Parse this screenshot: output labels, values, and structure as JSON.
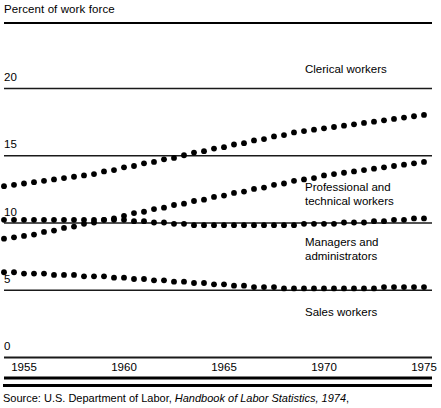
{
  "title": "Percent of work force",
  "source": {
    "prefix": "Source: U.S. Department of Labor, ",
    "italic": "Handbook of Labor Statistics, 1974",
    "suffix": ","
  },
  "axis": {
    "y_ticks": [
      "20",
      "15",
      "10",
      "5",
      "0"
    ],
    "x_ticks": [
      "1955",
      "1960",
      "1965",
      "1970",
      "1975"
    ]
  },
  "labels": {
    "clerical": "Clerical workers",
    "professional_line1": "Professional and",
    "professional_line2": "technical workers",
    "managers_line1": "Managers and",
    "managers_line2": "administrators",
    "sales": "Sales workers"
  },
  "colors": {
    "ink": "#000000",
    "rule": "#1a1a1a"
  },
  "chart_data": {
    "type": "scatter",
    "title": "Percent of work force",
    "xlabel": "",
    "ylabel": "Percent of work force",
    "xlim": [
      1954,
      1975.5
    ],
    "ylim": [
      0,
      21
    ],
    "ytick_values": [
      20,
      15,
      10,
      5,
      0
    ],
    "xtick_values": [
      1955,
      1960,
      1965,
      1970,
      1975
    ],
    "grid": "horizontal gridlines at each y tick",
    "legend_position": "inline labels at right of each series",
    "x": [
      1954,
      1954.5,
      1955,
      1955.5,
      1956,
      1956.5,
      1957,
      1957.5,
      1958,
      1958.5,
      1959,
      1959.5,
      1960,
      1960.5,
      1961,
      1961.5,
      1962,
      1962.5,
      1963,
      1963.5,
      1964,
      1964.5,
      1965,
      1965.5,
      1966,
      1966.5,
      1967,
      1967.5,
      1968,
      1968.5,
      1969,
      1969.5,
      1970,
      1970.5,
      1971,
      1971.5,
      1972,
      1972.5,
      1973,
      1973.5,
      1974,
      1974.5,
      1975
    ],
    "series": [
      {
        "name": "Clerical workers",
        "values": [
          12.7,
          12.8,
          12.9,
          13.0,
          13.1,
          13.2,
          13.3,
          13.4,
          13.5,
          13.6,
          13.8,
          13.9,
          14.1,
          14.2,
          14.4,
          14.5,
          14.7,
          14.8,
          15.0,
          15.2,
          15.3,
          15.5,
          15.6,
          15.8,
          15.9,
          16.1,
          16.2,
          16.4,
          16.5,
          16.7,
          16.8,
          16.9,
          17.0,
          17.1,
          17.2,
          17.3,
          17.4,
          17.5,
          17.6,
          17.7,
          17.8,
          17.9,
          18.0
        ]
      },
      {
        "name": "Professional and technical workers",
        "values": [
          8.8,
          8.9,
          9.0,
          9.1,
          9.3,
          9.4,
          9.6,
          9.7,
          9.9,
          10.0,
          10.2,
          10.3,
          10.5,
          10.7,
          10.8,
          11.0,
          11.1,
          11.3,
          11.4,
          11.6,
          11.7,
          11.9,
          12.0,
          12.2,
          12.3,
          12.5,
          12.6,
          12.8,
          12.9,
          13.1,
          13.2,
          13.3,
          13.5,
          13.6,
          13.7,
          13.8,
          13.9,
          14.0,
          14.1,
          14.2,
          14.3,
          14.4,
          14.5
        ]
      },
      {
        "name": "Managers and administrators",
        "values": [
          10.2,
          10.2,
          10.2,
          10.2,
          10.2,
          10.2,
          10.2,
          10.2,
          10.2,
          10.2,
          10.2,
          10.2,
          10.2,
          10.1,
          10.1,
          10.0,
          10.0,
          9.9,
          9.9,
          9.8,
          9.8,
          9.8,
          9.8,
          9.8,
          9.8,
          9.8,
          9.8,
          9.8,
          9.8,
          9.8,
          9.9,
          9.9,
          9.9,
          9.9,
          10.0,
          10.0,
          10.0,
          10.1,
          10.1,
          10.2,
          10.2,
          10.3,
          10.3
        ]
      },
      {
        "name": "Sales workers",
        "values": [
          6.3,
          6.3,
          6.2,
          6.2,
          6.2,
          6.1,
          6.1,
          6.1,
          6.0,
          6.0,
          6.0,
          5.9,
          5.9,
          5.8,
          5.8,
          5.7,
          5.7,
          5.6,
          5.6,
          5.5,
          5.5,
          5.4,
          5.4,
          5.3,
          5.3,
          5.2,
          5.2,
          5.2,
          5.1,
          5.1,
          5.1,
          5.1,
          5.1,
          5.1,
          5.1,
          5.1,
          5.1,
          5.1,
          5.2,
          5.2,
          5.2,
          5.2,
          5.2
        ]
      }
    ]
  }
}
